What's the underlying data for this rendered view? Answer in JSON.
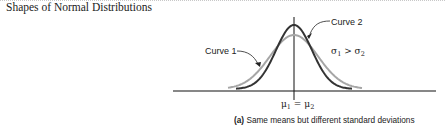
{
  "title": "Shapes of Normal Distributions",
  "figure": {
    "curve1_label": "Curve 1",
    "curve2_label": "Curve 2",
    "sigma_relation": {
      "left": "σ",
      "left_sub": "1",
      "op": " > ",
      "right": "σ",
      "right_sub": "2"
    },
    "mean_label": {
      "left": "μ",
      "left_sub": "1",
      "op": " = ",
      "right": "μ",
      "right_sub": "2"
    },
    "caption_prefix": "(a)",
    "caption_text": " Same means but different standard deviations"
  },
  "colors": {
    "curve1": "#a6a6a6",
    "curve2": "#333333",
    "axis": "#111111",
    "text": "#222222"
  },
  "chart_data": {
    "type": "line",
    "title": "Shapes of Normal Distributions",
    "caption": "(a) Same means but different standard deviations",
    "series": [
      {
        "name": "Curve 1",
        "distribution": "normal",
        "mean": "μ1",
        "relative_sigma": "larger",
        "color": "#a6a6a6"
      },
      {
        "name": "Curve 2",
        "distribution": "normal",
        "mean": "μ2",
        "relative_sigma": "smaller",
        "color": "#333333"
      }
    ],
    "annotations": [
      "σ1 > σ2",
      "μ1 = μ2"
    ],
    "xlabel": "",
    "ylabel": "",
    "grid": false,
    "legend": "inline labels with arrows"
  }
}
